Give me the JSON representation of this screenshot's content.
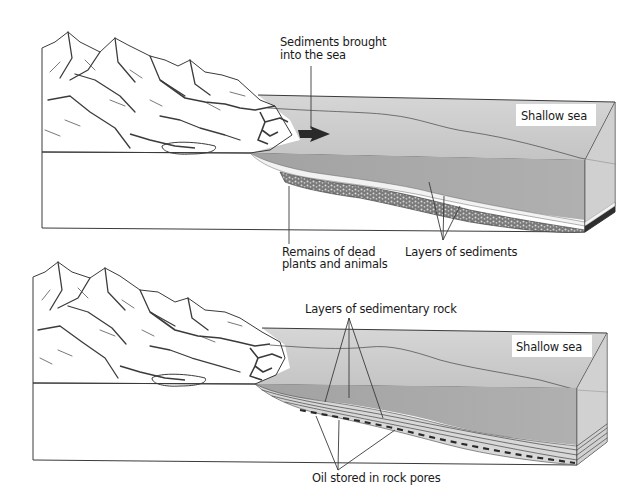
{
  "diagram": {
    "colors": {
      "background": "#ffffff",
      "ground_face": "#e2e2e2",
      "mountain_light": "#d4d4d4",
      "mountain_mid": "#b6b6b6",
      "mountain_dark": "#8c8c8c",
      "sea_surface": "#cfcfcf",
      "sea_body": "#a9a9a9",
      "sediment_light": "#efefef",
      "sediment_dark": "#3c3c3c",
      "outline": "#3a3a3a"
    },
    "panels": [
      {
        "id": "top",
        "stage": "Sediment deposition",
        "labels": {
          "sediments_line1": "Sediments brought",
          "sediments_line2": "into the sea",
          "sea": "Shallow sea",
          "remains_line1": "Remains of dead",
          "remains_line2": "plants and animals",
          "layers": "Layers of sediments"
        },
        "arrow": "sediment-flow-arrow"
      },
      {
        "id": "bottom",
        "stage": "Sedimentary rock with oil",
        "labels": {
          "rock_layers": "Layers of sedimentary rock",
          "sea": "Shallow sea",
          "oil": "Oil stored in rock pores"
        }
      }
    ]
  }
}
